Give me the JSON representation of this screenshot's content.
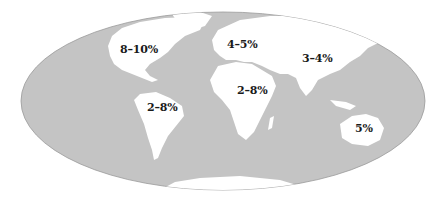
{
  "map": {
    "projection": "mollweide-like ellipse",
    "colors": {
      "ocean": "#c4c4c4",
      "land": "#ffffff",
      "outline": "#9a9a9a",
      "text": "#1a1a1a",
      "background": "#ffffff"
    },
    "regions": [
      {
        "name": "North America",
        "label": "8–10%",
        "x": 120,
        "y": 50
      },
      {
        "name": "Europe",
        "label": "4–5%",
        "x": 227,
        "y": 44
      },
      {
        "name": "Asia",
        "label": "3–4%",
        "x": 302,
        "y": 55
      },
      {
        "name": "Africa",
        "label": "2–8%",
        "x": 237,
        "y": 87
      },
      {
        "name": "South America",
        "label": "2–8%",
        "x": 147,
        "y": 105
      },
      {
        "name": "Australia",
        "label": "5%",
        "x": 355,
        "y": 124
      }
    ]
  }
}
